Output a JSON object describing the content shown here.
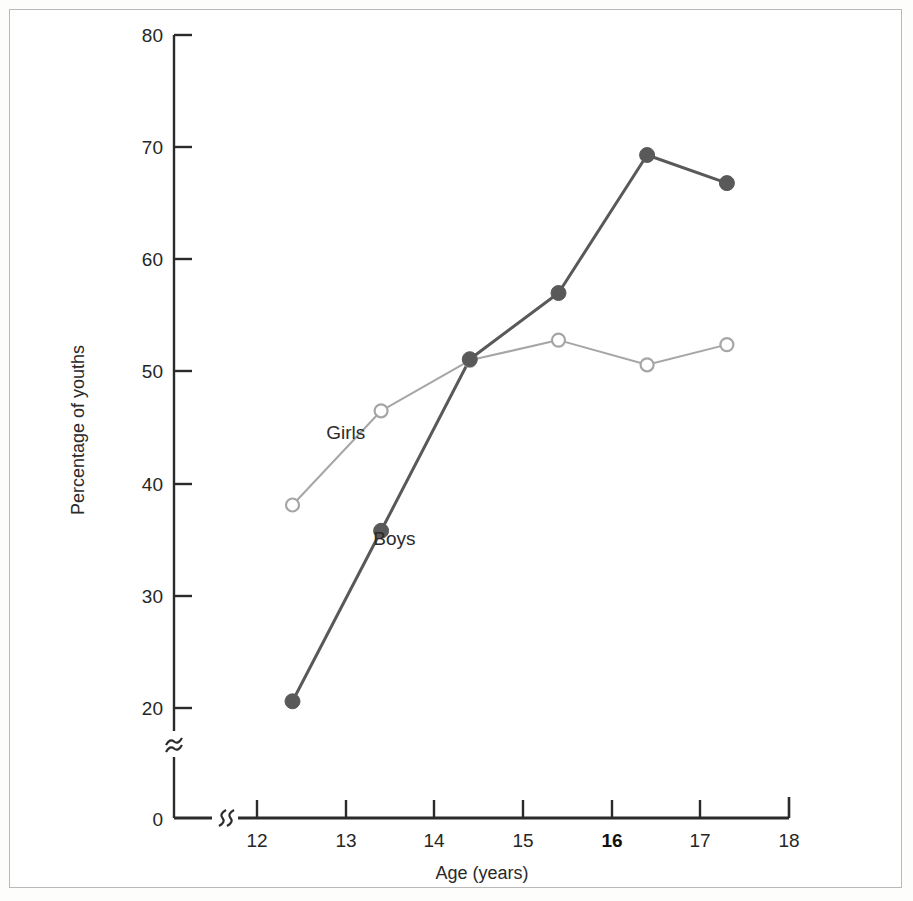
{
  "chart_data": {
    "type": "line",
    "title": "",
    "xlabel": "Age (years)",
    "ylabel": "Percentage of youths",
    "xlim": [
      11.62,
      18.0
    ],
    "ylim": [
      0,
      80
    ],
    "grid": false,
    "legend_position": "inline-annotations",
    "axis_breaks": {
      "x": "break between origin and 12",
      "y": "break between 0 and 20"
    },
    "x": [
      12.4,
      13.4,
      14.4,
      15.4,
      16.4,
      17.3
    ],
    "xticks": [
      "12",
      "13",
      "14",
      "15",
      "16",
      "17",
      "18"
    ],
    "xtick_values": [
      12,
      13,
      14,
      15,
      16,
      17,
      18
    ],
    "xtick_emphasis": "16",
    "yticks": [
      "0",
      "20",
      "30",
      "40",
      "50",
      "60",
      "70",
      "80"
    ],
    "ytick_values": [
      0,
      20,
      30,
      40,
      50,
      60,
      70,
      80
    ],
    "series": [
      {
        "name": "Boys",
        "marker": "filled-circle",
        "color": "#595959",
        "linewidth": 3.0,
        "values": [
          20.6,
          35.8,
          51.1,
          57.0,
          69.3,
          66.8
        ]
      },
      {
        "name": "Girls",
        "marker": "open-circle",
        "color": "#a6a6a6",
        "linewidth": 2.0,
        "values": [
          38.1,
          46.5,
          51.0,
          52.8,
          50.6,
          52.4
        ]
      }
    ],
    "annotations": [
      {
        "text": "Girls",
        "x": 13.0,
        "y": 44.0
      },
      {
        "text": "Boys",
        "x": 13.55,
        "y": 34.5
      }
    ]
  },
  "axis_colors": {
    "axis_line": "#2b2b2b",
    "frame": "#b9b9b9"
  }
}
